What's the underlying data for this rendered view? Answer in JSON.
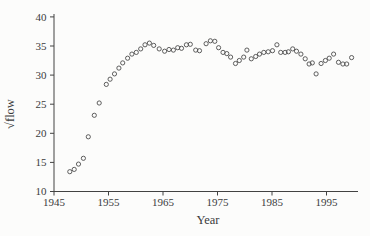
{
  "figure": {
    "background": "#fcfcfb",
    "ink_color": "#424242",
    "marker_color": "#4d4d4d"
  },
  "chart_data": {
    "type": "scatter",
    "title": "",
    "xlabel": "Year",
    "ylabel": "√flow",
    "x_ticks": [
      1945,
      1955,
      1965,
      1975,
      1985,
      1995
    ],
    "y_ticks": [
      10,
      15,
      20,
      25,
      30,
      35,
      40
    ],
    "xlim": [
      1945,
      2001
    ],
    "ylim": [
      10,
      40
    ],
    "grid": false,
    "marker": "open-circle",
    "points": [
      [
        1947.9,
        13.4
      ],
      [
        1948.7,
        13.8
      ],
      [
        1949.5,
        14.7
      ],
      [
        1950.4,
        15.7
      ],
      [
        1951.3,
        19.4
      ],
      [
        1952.4,
        23.1
      ],
      [
        1953.3,
        25.2
      ],
      [
        1954.6,
        28.4
      ],
      [
        1955.3,
        29.3
      ],
      [
        1956.1,
        30.2
      ],
      [
        1956.9,
        31.2
      ],
      [
        1957.6,
        32.1
      ],
      [
        1958.5,
        32.9
      ],
      [
        1959.3,
        33.6
      ],
      [
        1960.1,
        33.9
      ],
      [
        1960.9,
        34.5
      ],
      [
        1961.7,
        35.2
      ],
      [
        1962.5,
        35.5
      ],
      [
        1963.3,
        35.1
      ],
      [
        1964.3,
        34.5
      ],
      [
        1965.3,
        34.1
      ],
      [
        1966.1,
        34.4
      ],
      [
        1966.9,
        34.3
      ],
      [
        1967.7,
        34.7
      ],
      [
        1968.4,
        34.6
      ],
      [
        1969.3,
        35.2
      ],
      [
        1970.0,
        35.3
      ],
      [
        1971.0,
        34.3
      ],
      [
        1971.7,
        34.2
      ],
      [
        1972.9,
        35.4
      ],
      [
        1973.7,
        35.9
      ],
      [
        1974.5,
        35.8
      ],
      [
        1975.2,
        34.7
      ],
      [
        1976.0,
        33.9
      ],
      [
        1976.7,
        33.7
      ],
      [
        1977.4,
        33.1
      ],
      [
        1978.3,
        32.0
      ],
      [
        1979.0,
        32.5
      ],
      [
        1979.8,
        33.1
      ],
      [
        1980.4,
        34.3
      ],
      [
        1981.2,
        32.8
      ],
      [
        1982.0,
        33.2
      ],
      [
        1982.7,
        33.6
      ],
      [
        1983.5,
        33.9
      ],
      [
        1984.3,
        34.0
      ],
      [
        1985.1,
        34.2
      ],
      [
        1985.9,
        35.2
      ],
      [
        1986.6,
        33.9
      ],
      [
        1987.4,
        33.9
      ],
      [
        1988.0,
        34.0
      ],
      [
        1988.8,
        34.5
      ],
      [
        1989.5,
        34.1
      ],
      [
        1990.3,
        33.6
      ],
      [
        1991.1,
        32.8
      ],
      [
        1991.8,
        31.9
      ],
      [
        1992.4,
        32.1
      ],
      [
        1993.1,
        30.2
      ],
      [
        1994.0,
        32.0
      ],
      [
        1994.8,
        32.5
      ],
      [
        1995.5,
        32.9
      ],
      [
        1996.3,
        33.6
      ],
      [
        1997.2,
        32.2
      ],
      [
        1998.0,
        31.9
      ],
      [
        1998.7,
        31.9
      ],
      [
        1999.6,
        33.0
      ]
    ]
  }
}
